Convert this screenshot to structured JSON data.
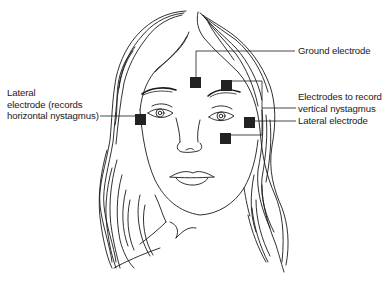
{
  "figure": {
    "colors": {
      "line": "#1a1a1a",
      "electrode": "#222222",
      "background": "#ffffff"
    }
  },
  "labels": {
    "ground": "Ground electrode",
    "vertical": {
      "line1": "Electrodes to record",
      "line2": "vertical nystagmus"
    },
    "lateral_right": "Lateral electrode",
    "lateral_left": {
      "line1": "Lateral",
      "line2": "electrode (records",
      "line3": "horizontal nystagmus)"
    }
  },
  "electrodes": [
    {
      "id": "ground",
      "x": 190,
      "y": 77,
      "size": 11
    },
    {
      "id": "vertical-upper",
      "x": 221,
      "y": 80,
      "size": 11
    },
    {
      "id": "lateral-left",
      "x": 135,
      "y": 114,
      "size": 11
    },
    {
      "id": "lateral-right",
      "x": 244,
      "y": 117,
      "size": 11
    },
    {
      "id": "vertical-lower",
      "x": 220,
      "y": 133,
      "size": 11
    }
  ]
}
